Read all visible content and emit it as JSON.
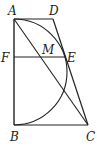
{
  "diagram": {
    "type": "geometry",
    "stroke_color": "#222222",
    "points": {
      "A": {
        "label": "A",
        "x": 14,
        "y": 19
      },
      "D": {
        "label": "D",
        "x": 53,
        "y": 19
      },
      "B": {
        "label": "B",
        "x": 14,
        "y": 125
      },
      "C": {
        "label": "C",
        "x": 88,
        "y": 125
      },
      "F": {
        "label": "F",
        "x": 14,
        "y": 57
      },
      "E": {
        "label": "E",
        "x": 66,
        "y": 57
      },
      "M": {
        "label": "M",
        "x": 40,
        "y": 57
      }
    },
    "segments": [
      "AD",
      "DC",
      "CB",
      "BA",
      "AC",
      "FE"
    ],
    "arcs": [
      {
        "name": "semicircle-AB",
        "from": "A",
        "to": "B",
        "center": [
          14,
          72
        ],
        "radius": 53,
        "side": "right",
        "tangent_to": "DC",
        "touch_point": "E"
      }
    ],
    "labels": {
      "A": "A",
      "B": "B",
      "C": "C",
      "D": "D",
      "E": "E",
      "F": "F",
      "M": "M"
    }
  }
}
